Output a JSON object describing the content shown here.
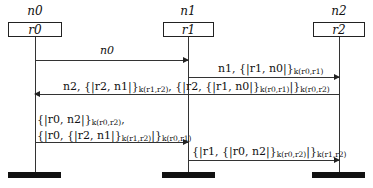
{
  "diagram": {
    "type": "sequence-diagram",
    "participants": [
      {
        "id": "n0",
        "name": "n0",
        "role": "r0",
        "x": 35
      },
      {
        "id": "n1",
        "name": "n1",
        "role": "r1",
        "x": 188
      },
      {
        "id": "n2",
        "name": "n2",
        "role": "r2",
        "x": 339
      }
    ],
    "messages": [
      {
        "from": "n0",
        "to": "n1",
        "label": "n0"
      },
      {
        "from": "n1",
        "to": "n2",
        "label": "n1, {|r1, n0|}k(r0,r1)",
        "parts": {
          "prefix": "n1, {|r1, n0|}",
          "sub": "k(r0,r1)"
        }
      },
      {
        "from": "n2",
        "to": "n0",
        "label": "n2, {|r2, n1|}k(r1,r2), {|r2, {|r1, n0|}k(r0,r1)|}k(r0,r2)",
        "parts": {
          "p1": "n2, {|r2, n1|}",
          "s1": "k(r1,r2)",
          "p2": ", {|r2, {|r1, n0|}",
          "s2": "k(r0,r1)",
          "p3": "|}",
          "s3": "k(r0,r2)"
        }
      },
      {
        "from": "n0",
        "to": "n1",
        "label": "{|r0, n2|}k(r0,r2), {|r0, {|r2, n1|}k(r1,r2)|}k(r0,r1)",
        "parts": {
          "l1p": "{|r0, n2|}",
          "l1s": "k(r0,r2)",
          "l1c": ",",
          "l2p": "{|r0, {|r2, n1|}",
          "l2s": "k(r1,r2)",
          "l2m": "|}",
          "l2s2": "k(r0,r1)"
        }
      },
      {
        "from": "n1",
        "to": "n2",
        "label": "{|r1, {|r0, n2|}k(r0,r2)|}k(r1,r2)",
        "parts": {
          "p1": "{|r1, {|r0, n2|}",
          "s1": "k(r0,r2)",
          "p2": "|}",
          "s2": "k(r1,r2)"
        }
      }
    ]
  }
}
